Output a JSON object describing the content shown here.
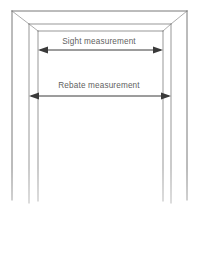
{
  "diagram": {
    "line_color": "#555555",
    "arrow_color": "#3a3a3a",
    "text_color": "#5f5f5f",
    "background_color": "#ffffff",
    "dimensions": [
      {
        "id": "sight",
        "label": "Sight measurement",
        "arrow_style": "double-headed",
        "y": 50,
        "x_start": 38,
        "x_end": 163
      },
      {
        "id": "rebate",
        "label": "Rebate measurement",
        "arrow_style": "double-headed",
        "y": 96,
        "x_start": 29,
        "x_end": 171
      }
    ]
  }
}
